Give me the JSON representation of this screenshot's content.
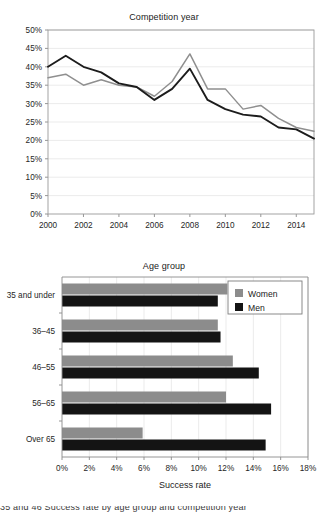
{
  "chart_data": [
    {
      "type": "line",
      "title": "Competition year",
      "xlabel": "",
      "ylabel": "",
      "xlim": [
        2000,
        2015
      ],
      "ylim": [
        0,
        50
      ],
      "grid": true,
      "legend_position": "none",
      "x": [
        2000,
        2001,
        2002,
        2003,
        2004,
        2005,
        2006,
        2007,
        2008,
        2009,
        2010,
        2011,
        2012,
        2013,
        2014,
        2015
      ],
      "x_tick_labels": [
        "2000",
        "2002",
        "2004",
        "2006",
        "2008",
        "2010",
        "2012",
        "2014"
      ],
      "y_tick_labels": [
        "0%",
        "5%",
        "10%",
        "15%",
        "20%",
        "25%",
        "30%",
        "35%",
        "40%",
        "45%",
        "50%"
      ],
      "series": [
        {
          "name": "Men",
          "color": "#1c1c1c",
          "values": [
            40.0,
            43.0,
            40.0,
            38.5,
            35.5,
            34.5,
            31.0,
            34.0,
            39.5,
            31.0,
            28.5,
            27.0,
            26.5,
            23.5,
            23.0,
            20.5
          ]
        },
        {
          "name": "Women",
          "color": "#8f8f8f",
          "values": [
            37.0,
            38.0,
            35.0,
            36.5,
            35.0,
            34.5,
            32.0,
            36.0,
            43.5,
            34.0,
            34.0,
            28.5,
            29.5,
            26.0,
            23.5,
            22.5
          ]
        }
      ]
    },
    {
      "type": "bar",
      "orientation": "horizontal",
      "title": "Age group",
      "xlabel": "Success rate",
      "ylabel": "",
      "xlim": [
        0,
        18
      ],
      "grid": true,
      "legend_position": "top-right",
      "categories": [
        "35 and under",
        "36–45",
        "46–55",
        "56–65",
        "Over 65"
      ],
      "x_tick_labels": [
        "0%",
        "2%",
        "4%",
        "6%",
        "8%",
        "10%",
        "12%",
        "14%",
        "16%",
        "18%"
      ],
      "series": [
        {
          "name": "Women",
          "color": "#8c8c8c",
          "values": [
            12.1,
            11.4,
            12.5,
            12.0,
            5.9
          ]
        },
        {
          "name": "Men",
          "color": "#141414",
          "values": [
            11.4,
            11.6,
            14.4,
            15.3,
            14.9
          ]
        }
      ]
    }
  ],
  "line_chart": {
    "title": "Competition year"
  },
  "bar_chart": {
    "title": "Age group",
    "axis_title": "Success rate",
    "legend": [
      {
        "label": "Women",
        "color": "#8c8c8c"
      },
      {
        "label": "Men",
        "color": "#141414"
      }
    ]
  },
  "bottom_cut_text": "35 and 46 Success rate by age group and competition year"
}
